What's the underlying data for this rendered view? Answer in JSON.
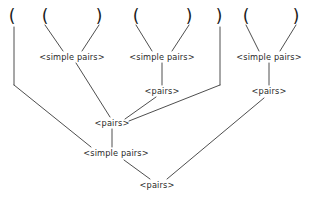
{
  "diagram": {
    "grammar_nonterminals": [
      "<simple pairs>",
      "<pairs>"
    ],
    "background_color": "#ffffff",
    "line_color": "#3a3a3a",
    "text_color": "#2a2a2a",
    "terminals": [
      {
        "id": "t1",
        "text": "(",
        "x": 12,
        "y": 8
      },
      {
        "id": "t2",
        "text": "(",
        "x": 45,
        "y": 8
      },
      {
        "id": "t3",
        "text": ")",
        "x": 99,
        "y": 8
      },
      {
        "id": "t4",
        "text": "(",
        "x": 136,
        "y": 8
      },
      {
        "id": "t5",
        "text": ")",
        "x": 189,
        "y": 8
      },
      {
        "id": "t6",
        "text": ")",
        "x": 219,
        "y": 8
      },
      {
        "id": "t7",
        "text": "(",
        "x": 246,
        "y": 8
      },
      {
        "id": "t8",
        "text": ")",
        "x": 296,
        "y": 8
      }
    ],
    "nodes": [
      {
        "id": "sp1",
        "label": "<simple pairs>",
        "x": 72,
        "y": 57
      },
      {
        "id": "sp2",
        "label": "<simple pairs>",
        "x": 162,
        "y": 57
      },
      {
        "id": "sp3",
        "label": "<simple pairs>",
        "x": 269,
        "y": 57
      },
      {
        "id": "p_mid_right",
        "label": "<pairs>",
        "x": 162,
        "y": 91
      },
      {
        "id": "p_right",
        "label": "<pairs>",
        "x": 269,
        "y": 91
      },
      {
        "id": "p_center",
        "label": "<pairs>",
        "x": 112,
        "y": 123
      },
      {
        "id": "sp_bottom",
        "label": "<simple pairs>",
        "x": 116,
        "y": 153
      },
      {
        "id": "p_root",
        "label": "<pairs>",
        "x": 157,
        "y": 185
      }
    ],
    "edges": [
      {
        "from": "t2",
        "to": "sp1",
        "x1": 45,
        "y1": 25,
        "x2": 63,
        "y2": 51
      },
      {
        "from": "t3",
        "to": "sp1",
        "x1": 99,
        "y1": 25,
        "x2": 82,
        "y2": 51
      },
      {
        "from": "t4",
        "to": "sp2",
        "x1": 136,
        "y1": 25,
        "x2": 152,
        "y2": 51
      },
      {
        "from": "t5",
        "to": "sp2",
        "x1": 189,
        "y1": 25,
        "x2": 172,
        "y2": 51
      },
      {
        "from": "t7",
        "to": "sp3",
        "x1": 246,
        "y1": 25,
        "x2": 259,
        "y2": 51
      },
      {
        "from": "t8",
        "to": "sp3",
        "x1": 296,
        "y1": 25,
        "x2": 280,
        "y2": 51
      },
      {
        "from": "sp2",
        "to": "p_mid_right",
        "x1": 162,
        "y1": 63,
        "x2": 162,
        "y2": 85
      },
      {
        "from": "sp3",
        "to": "p_right",
        "x1": 269,
        "y1": 63,
        "x2": 269,
        "y2": 85
      },
      {
        "from": "sp1",
        "to": "p_center",
        "x1": 76,
        "y1": 63,
        "x2": 110,
        "y2": 117
      },
      {
        "from": "p_mid_right",
        "to": "p_center",
        "x1": 155,
        "y1": 97,
        "x2": 124,
        "y2": 119
      },
      {
        "from": "t1",
        "to": "sp_bottom",
        "x1": 14,
        "y1": 27,
        "x2": 14,
        "y2": 85
      },
      {
        "from": "t1_diag",
        "to": "sp_bottom",
        "x1": 14,
        "y1": 85,
        "x2": 90,
        "y2": 147
      },
      {
        "from": "p_center",
        "to": "sp_bottom",
        "x1": 112,
        "y1": 129,
        "x2": 112,
        "y2": 147
      },
      {
        "from": "t6",
        "to": "p_center_right",
        "x1": 220,
        "y1": 27,
        "x2": 220,
        "y2": 85
      },
      {
        "from": "t6_diag",
        "to": "p_center",
        "x1": 220,
        "y1": 85,
        "x2": 128,
        "y2": 121
      },
      {
        "from": "sp_bottom",
        "to": "p_root",
        "x1": 124,
        "y1": 160,
        "x2": 150,
        "y2": 179
      },
      {
        "from": "p_right",
        "to": "p_root",
        "x1": 264,
        "y1": 98,
        "x2": 166,
        "y2": 179
      }
    ]
  }
}
